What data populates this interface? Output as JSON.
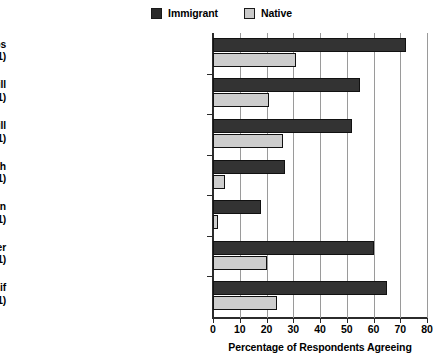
{
  "chart_data": {
    "type": "bar",
    "orientation": "horizontal",
    "title": "",
    "xlabel": "Percentage of Respondents Agreeing",
    "ylabel": "",
    "xlim": [
      0,
      80
    ],
    "xticks": [
      0,
      10,
      20,
      30,
      40,
      50,
      60,
      70,
      80
    ],
    "grid": true,
    "legend_position": "top-center",
    "categories": [
      "Immigrants (do not) take jobs from natives. (p < .001)",
      "Hispanic people will improve life here. (p < .001)",
      "Asian people will improve  life here. (p < .001)",
      "This town would be better with more immigrants. (p < .001)",
      "Immigrants should (not have to) learn to speak English ASAP. (p < .001)",
      "Immigrants work harder than natives. (p < .001)",
      "There would (not) be fewer problems if there were (more) immigrants. (p < .001)"
    ],
    "category_lines": [
      [
        "Immigrants (do not) take jobs",
        "from natives. (p < .001)"
      ],
      [
        "Hispanic people will",
        "improve life here. (p < .001)"
      ],
      [
        "Asian people will",
        "improve  life here. (p < .001)"
      ],
      [
        "This town would be better with",
        "more immigrants. (p < .001)"
      ],
      [
        "Immigrants should (not have to) learn",
        "to speak English ASAP. (p < .001)"
      ],
      [
        "Immigrants work harder",
        "than natives. (p < .001)"
      ],
      [
        "There would (not) be fewer problems if",
        "there were (more) immigrants. (p < .001)"
      ]
    ],
    "series": [
      {
        "name": "Immigrant",
        "color": "#333333",
        "values": [
          72,
          55,
          52,
          27,
          18,
          60,
          65
        ]
      },
      {
        "name": "Native",
        "color": "#cdcdcd",
        "values": [
          31,
          21,
          26,
          4.5,
          2,
          20,
          24
        ]
      }
    ]
  },
  "legend": {
    "entries": [
      {
        "label": "Immigrant",
        "swatch": "immigrant-swatch"
      },
      {
        "label": "Native",
        "swatch": "native-swatch"
      }
    ]
  },
  "axis": {
    "x_title": "Percentage of Respondents Agreeing",
    "tick_labels": [
      "0",
      "10",
      "20",
      "30",
      "40",
      "50",
      "60",
      "70",
      "80"
    ]
  }
}
